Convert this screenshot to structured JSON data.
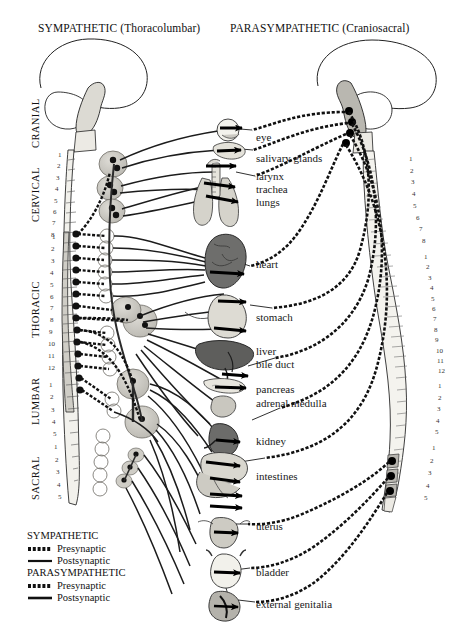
{
  "figure": {
    "titles": {
      "left": "SYMPATHETIC (Thoracolumbar)",
      "right": "PARASYMPATHETIC (Craniosacral)"
    },
    "region_labels": [
      "CRANIAL",
      "CERVICAL",
      "THORACIC",
      "LUMBAR",
      "SACRAL"
    ],
    "organs": [
      {
        "name": "eye"
      },
      {
        "name": "salivary glands"
      },
      {
        "name": "larynx"
      },
      {
        "name": "trachea"
      },
      {
        "name": "lungs"
      },
      {
        "name": "heart"
      },
      {
        "name": "stomach"
      },
      {
        "name": "liver"
      },
      {
        "name": "bile duct"
      },
      {
        "name": "pancreas"
      },
      {
        "name": "adrenal medulla"
      },
      {
        "name": "kidney"
      },
      {
        "name": "intestines"
      },
      {
        "name": "uterus"
      },
      {
        "name": "bladder"
      },
      {
        "name": "external genitalia"
      }
    ],
    "legend": {
      "groups": [
        {
          "title": "SYMPATHETIC",
          "entries": [
            {
              "label": "Presynaptic",
              "style": "beaded"
            },
            {
              "label": "Postsynaptic",
              "style": "solid"
            }
          ]
        },
        {
          "title": "PARASYMPATHETIC",
          "entries": [
            {
              "label": "Presynaptic",
              "style": "beaded"
            },
            {
              "label": "Postsynaptic",
              "style": "solid"
            }
          ]
        }
      ]
    },
    "spine_segments": {
      "cervical": [
        "1",
        "2",
        "3",
        "4",
        "5",
        "6",
        "7",
        "8"
      ],
      "thoracic": [
        "1",
        "2",
        "3",
        "4",
        "5",
        "6",
        "7",
        "8",
        "9",
        "10",
        "11",
        "12"
      ],
      "lumbar": [
        "1",
        "2",
        "3",
        "4",
        "5"
      ],
      "sacral": [
        "1",
        "2",
        "3",
        "4",
        "5"
      ]
    },
    "colors": {
      "ink": "#000000",
      "background": "#ffffff",
      "cord_gray": "#cfcdc6",
      "organ_light": "#ddddd6",
      "organ_mid": "#bdbcb4",
      "organ_dark": "#6e6e6c",
      "ganglion": "#c9c8c2",
      "text": "#111111"
    }
  }
}
